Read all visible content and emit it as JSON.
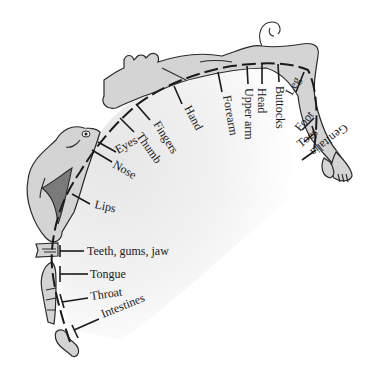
{
  "colors": {
    "background": "#ffffff",
    "cortex_shade": "#ececec",
    "body_fill": "#d4d4d4",
    "mouth_fill": "#7a7a7a",
    "ink": "#1a1a1a"
  },
  "labels": {
    "genitalia": "Genitalia",
    "toes": "Toes",
    "foot": "Foot",
    "leg": "Leg",
    "buttocks": "Buttocks",
    "head": "Head",
    "upper_arm": "Upper arm",
    "forearm": "Forearm",
    "hand": "Hand",
    "fingers": "Fingers",
    "thumb": "Thumb",
    "eyes": "Eyes",
    "nose": "Nose",
    "lips": "Lips",
    "teeth": "Teeth, gums, jaw",
    "tongue": "Tongue",
    "throat": "Throat",
    "intestines": "Intestines"
  }
}
